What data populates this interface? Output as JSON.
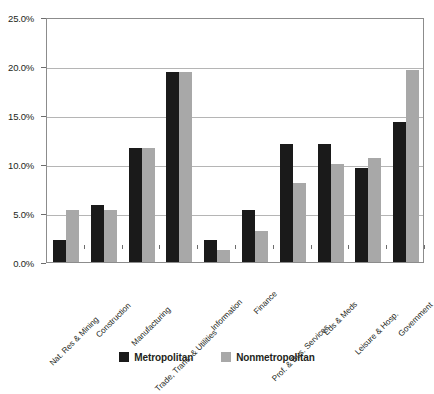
{
  "chart_data": {
    "type": "bar",
    "title": "",
    "xlabel": "",
    "ylabel": "",
    "ylim": [
      0,
      25
    ],
    "ytick_values": [
      0,
      5,
      10,
      15,
      20,
      25
    ],
    "ytick_labels": [
      "0.0%",
      "5.0%",
      "10.0%",
      "15.0%",
      "20.0%",
      "25.0%"
    ],
    "grid": true,
    "legend_position": "bottom-center",
    "value_format": "percent",
    "categories": [
      "Nat. Res & Mining",
      "Construction",
      "Manufacturing",
      "Trade, Trans. & Utilities",
      "Information",
      "Finance",
      "Prof. & Bus. Services",
      "Eds & Meds",
      "Leisure & Hosp.",
      "Government"
    ],
    "series": [
      {
        "name": "Metropolitan",
        "color": "#1a1a1a",
        "values": [
          2.2,
          5.8,
          11.6,
          19.4,
          2.2,
          5.3,
          12.0,
          12.0,
          9.6,
          14.3
        ]
      },
      {
        "name": "Nonmetropolitan",
        "color": "#a8a8a8",
        "values": [
          5.3,
          5.3,
          11.6,
          19.4,
          1.2,
          3.2,
          8.1,
          10.0,
          10.6,
          19.6
        ]
      }
    ]
  },
  "legend": {
    "entries": [
      {
        "label": "Metropolitan",
        "swatch": "metro-swatch"
      },
      {
        "label": "Nonmetropolitan",
        "swatch": "nonmetro-swatch"
      }
    ]
  },
  "colors": {
    "metropolitan": "#1a1a1a",
    "nonmetropolitan": "#a8a8a8",
    "gridline": "#b5b5b5",
    "frame": "#8c8c8c",
    "text": "#231f20",
    "background": "#ffffff"
  }
}
